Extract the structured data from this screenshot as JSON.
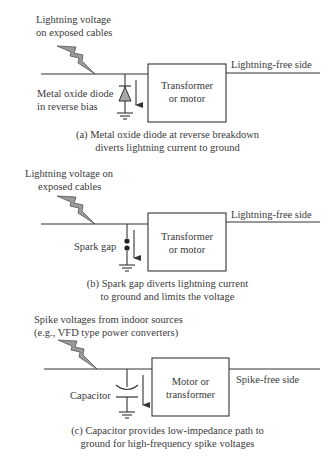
{
  "panels": [
    {
      "id": "a",
      "source_label": [
        "Lightning voltage",
        "on exposed cables"
      ],
      "component_label": [
        "Metal oxide diode",
        "in reverse bias"
      ],
      "component": "diode",
      "box_label": [
        "Transformer",
        "or motor"
      ],
      "output_label": "Lightning-free side",
      "caption": [
        "(a) Metal oxide diode at reverse breakdown",
        "diverts lightning current to ground"
      ]
    },
    {
      "id": "b",
      "source_label": [
        "Lightning voltage on",
        "exposed cables"
      ],
      "component_label": [
        "Spark gap"
      ],
      "component": "spark-gap",
      "box_label": [
        "Transformer",
        "or motor"
      ],
      "output_label": "Lightning-free side",
      "caption": [
        "(b) Spark gap diverts lightning current",
        "to ground and limits the voltage"
      ]
    },
    {
      "id": "c",
      "source_label": [
        "Spike voltages from indoor sources",
        "(e.g., VFD type power converters)"
      ],
      "component_label": [
        "Capacitor"
      ],
      "component": "capacitor",
      "box_label": [
        "Motor or",
        "transformer"
      ],
      "output_label": "Spike-free side",
      "caption": [
        "(c) Capacitor provides low-impedance path to",
        "ground for high-frequency spike voltages"
      ]
    }
  ],
  "icons": {
    "lightning": "lightning-bolt-icon",
    "ground": "ground-symbol-icon",
    "arrow": "current-arrow-icon"
  },
  "colors": {
    "line": "#333333",
    "bolt_fill": "#9a9a9a",
    "diode_fill": "#a8a8a8"
  }
}
